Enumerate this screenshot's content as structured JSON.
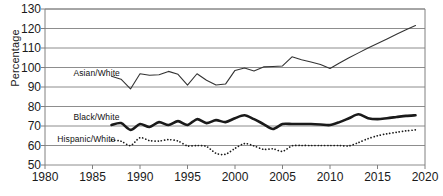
{
  "chart_data": {
    "type": "line",
    "title": "",
    "xlabel": "",
    "ylabel": "Percentage",
    "xlim": [
      1980,
      2020
    ],
    "ylim": [
      50,
      130
    ],
    "ytick_labels": [
      "130",
      "120",
      "110",
      "100",
      "90",
      "80",
      "70",
      "60",
      "50"
    ],
    "xtick_labels": [
      "1980",
      "1985",
      "1990",
      "1995",
      "2000",
      "2005",
      "2010",
      "2015",
      "2020"
    ],
    "yticks": [
      130,
      120,
      110,
      100,
      90,
      80,
      70,
      60,
      50
    ],
    "xticks": [
      1980,
      1985,
      1990,
      1995,
      2000,
      2005,
      2010,
      2015,
      2020
    ],
    "grid": "horizontal",
    "legend_position": "inline-annotations",
    "series": [
      {
        "name": "Asian/White",
        "style": "solid-thin",
        "color": "#333333",
        "label_x": 1983.0,
        "label_y": 97.0,
        "x": [
          1987,
          1988,
          1989,
          1990,
          1991,
          1992,
          1993,
          1994,
          1995,
          1996,
          1997,
          1998,
          1999,
          2000,
          2001,
          2002,
          2003,
          2004,
          2005,
          2006,
          2007,
          2008,
          2009,
          2010,
          2011,
          2012,
          2013,
          2014,
          2015,
          2016,
          2017,
          2018,
          2019
        ],
        "values": [
          95.5,
          94.0,
          89.0,
          96.8,
          96.0,
          96.3,
          98.0,
          96.5,
          91.0,
          96.8,
          93.5,
          91.0,
          91.5,
          98.5,
          99.7,
          98.2,
          100.3,
          100.5,
          100.8,
          105.5,
          104.0,
          102.8,
          101.5,
          99.5,
          102.3,
          105.0,
          107.5,
          110.0,
          112.3,
          114.6,
          117.0,
          119.3,
          121.5
        ]
      },
      {
        "name": "Black/White",
        "style": "solid-thick",
        "color": "#1a1a1a",
        "label_x": 1983.0,
        "label_y": 74.5,
        "x": [
          1987,
          1988,
          1989,
          1990,
          1991,
          1992,
          1993,
          1994,
          1995,
          1996,
          1997,
          1998,
          1999,
          2000,
          2001,
          2002,
          2003,
          2004,
          2005,
          2006,
          2007,
          2008,
          2009,
          2010,
          2011,
          2012,
          2013,
          2014,
          2015,
          2016,
          2017,
          2018,
          2019
        ],
        "values": [
          70.5,
          71.5,
          68.0,
          71.0,
          69.5,
          72.0,
          70.5,
          72.5,
          70.5,
          73.5,
          71.5,
          73.0,
          72.0,
          74.0,
          75.5,
          73.5,
          71.0,
          68.5,
          71.0,
          71.0,
          71.0,
          71.0,
          70.8,
          70.5,
          72.0,
          74.0,
          76.0,
          74.0,
          73.5,
          74.0,
          74.6,
          75.2,
          75.5
        ]
      },
      {
        "name": "Hispanic/White",
        "style": "dotted",
        "color": "#1a1a1a",
        "label_x": 1981.3,
        "label_y": 63.2,
        "x": [
          1987,
          1988,
          1989,
          1990,
          1991,
          1992,
          1993,
          1994,
          1995,
          1996,
          1997,
          1998,
          1999,
          2000,
          2001,
          2002,
          2003,
          2004,
          2005,
          2006,
          2007,
          2008,
          2009,
          2010,
          2011,
          2012,
          2013,
          2014,
          2015,
          2016,
          2017,
          2018,
          2019
        ],
        "values": [
          62.8,
          62.2,
          60.0,
          64.0,
          62.5,
          62.3,
          63.0,
          62.3,
          59.8,
          60.0,
          59.5,
          56.0,
          55.5,
          58.5,
          61.0,
          59.8,
          58.0,
          58.3,
          57.0,
          59.8,
          60.0,
          60.0,
          60.0,
          60.0,
          60.0,
          59.8,
          61.5,
          63.5,
          65.0,
          66.0,
          66.8,
          67.5,
          68.0
        ]
      }
    ]
  },
  "axis": {
    "y_title": "Percentage"
  }
}
